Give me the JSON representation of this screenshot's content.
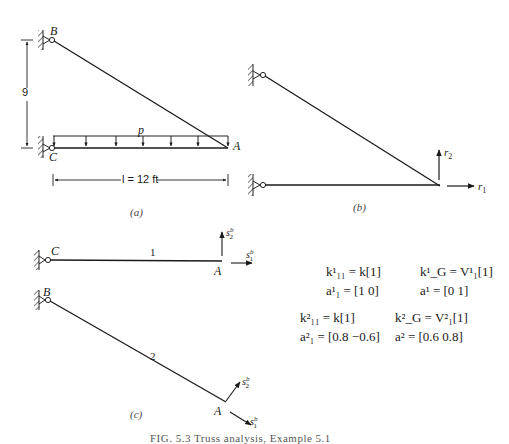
{
  "figure": {
    "caption": "FIG. 5.3   Truss analysis, Example 5.1",
    "panel_a": {
      "label": "(a)",
      "nodes": {
        "B": "B",
        "C": "C",
        "A": "A"
      },
      "load_label": "p",
      "vertical_dim": "9",
      "horizontal_dim": "l = 12 ft"
    },
    "panel_b": {
      "label": "(b)",
      "r1": "r",
      "r1_sub": "1",
      "r2": "r",
      "r2_sub": "2"
    },
    "panel_c": {
      "label": "(c)",
      "member1": {
        "id": "1",
        "start": "C",
        "end": "A"
      },
      "member2": {
        "id": "2",
        "start": "B",
        "end": "A"
      },
      "s": "s",
      "s_sup": "b",
      "s1_sub": "1",
      "s2_sub": "2"
    },
    "equations": {
      "m1_k11": "k¹₁₁ = k[1]",
      "m1_kG": "k¹_G = V¹₁[1]",
      "m1_a1": "a¹₁ = [1  0]",
      "m1_a": "a¹ = [0  1]",
      "m2_k11": "k²₁₁ = k[1]",
      "m2_kG": "k²_G = V²₁[1]",
      "m2_a1": "a²₁ = [0.8  −0.6]",
      "m2_a": "a² = [0.6  0.8]"
    }
  }
}
